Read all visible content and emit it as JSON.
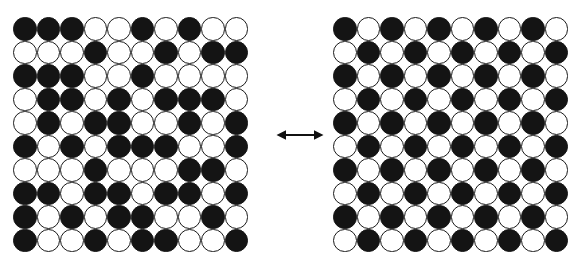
{
  "figure": {
    "background_color": "#ffffff",
    "site_colors": {
      "black": "#141414",
      "white": "#ffffff",
      "outline": "#1a1a1a"
    },
    "connector": {
      "name": "double-headed-arrow",
      "glyph": "↔",
      "direction": "bidirectional",
      "color": "#111111"
    },
    "panels": [
      {
        "id": "disordered",
        "label": "",
        "rows": 10,
        "cols": 10,
        "legend": {
          "black": "atom A",
          "white": "atom B"
        },
        "grid": [
          [
            "black",
            "black",
            "black",
            "white",
            "white",
            "black",
            "white",
            "black",
            "white",
            "white"
          ],
          [
            "white",
            "white",
            "white",
            "black",
            "white",
            "white",
            "black",
            "white",
            "black",
            "black"
          ],
          [
            "black",
            "black",
            "black",
            "white",
            "white",
            "black",
            "white",
            "white",
            "white",
            "white"
          ],
          [
            "white",
            "black",
            "black",
            "white",
            "black",
            "white",
            "black",
            "black",
            "black",
            "white"
          ],
          [
            "white",
            "black",
            "white",
            "black",
            "black",
            "white",
            "white",
            "black",
            "white",
            "black"
          ],
          [
            "black",
            "white",
            "black",
            "white",
            "black",
            "black",
            "black",
            "white",
            "white",
            "black"
          ],
          [
            "white",
            "white",
            "white",
            "black",
            "white",
            "white",
            "white",
            "black",
            "black",
            "white"
          ],
          [
            "black",
            "black",
            "white",
            "black",
            "black",
            "white",
            "black",
            "black",
            "white",
            "black"
          ],
          [
            "black",
            "white",
            "black",
            "white",
            "black",
            "black",
            "white",
            "white",
            "black",
            "white"
          ],
          [
            "black",
            "white",
            "white",
            "black",
            "white",
            "black",
            "black",
            "white",
            "white",
            "black"
          ]
        ]
      },
      {
        "id": "ordered",
        "label": "",
        "rows": 10,
        "cols": 10,
        "legend": {
          "black": "atom A",
          "white": "atom B"
        },
        "grid": [
          [
            "black",
            "white",
            "black",
            "white",
            "black",
            "white",
            "black",
            "white",
            "black",
            "white"
          ],
          [
            "white",
            "black",
            "white",
            "black",
            "white",
            "black",
            "white",
            "black",
            "white",
            "black"
          ],
          [
            "black",
            "white",
            "black",
            "white",
            "black",
            "white",
            "black",
            "white",
            "black",
            "white"
          ],
          [
            "white",
            "black",
            "white",
            "black",
            "white",
            "black",
            "white",
            "black",
            "white",
            "black"
          ],
          [
            "black",
            "white",
            "black",
            "white",
            "black",
            "white",
            "black",
            "white",
            "black",
            "white"
          ],
          [
            "white",
            "black",
            "white",
            "black",
            "white",
            "black",
            "white",
            "black",
            "white",
            "black"
          ],
          [
            "black",
            "white",
            "black",
            "white",
            "black",
            "white",
            "black",
            "white",
            "black",
            "white"
          ],
          [
            "white",
            "black",
            "white",
            "black",
            "white",
            "black",
            "white",
            "black",
            "white",
            "black"
          ],
          [
            "black",
            "white",
            "black",
            "white",
            "black",
            "white",
            "black",
            "white",
            "black",
            "white"
          ],
          [
            "white",
            "black",
            "white",
            "black",
            "white",
            "black",
            "white",
            "black",
            "white",
            "black"
          ]
        ]
      }
    ]
  },
  "chart_data": {
    "type": "heatmap",
    "xlabel": "",
    "ylabel": "",
    "grid": true,
    "legend": [
      "black = atom A",
      "white = atom B"
    ],
    "annotations": [
      "↔ bidirectional transition between disordered (left) and ordered (right) states"
    ],
    "panels": [
      "disordered",
      "ordered"
    ]
  }
}
